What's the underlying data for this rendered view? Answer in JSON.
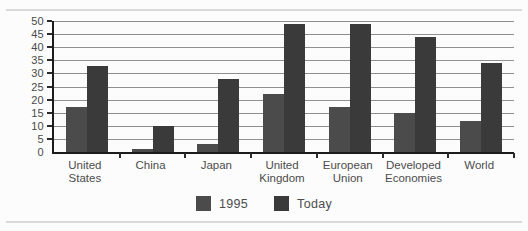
{
  "page": {
    "background": "#fcfcfc",
    "rule_color": "#d9d9d9"
  },
  "chart_data": {
    "type": "bar",
    "title": "",
    "xlabel": "",
    "ylabel": "",
    "categories": [
      "United\nStates",
      "China",
      "Japan",
      "United\nKingdom",
      "European\nUnion",
      "Developed\nEconomies",
      "World"
    ],
    "series": [
      {
        "name": "1995",
        "color": "#4b4b4b",
        "values": [
          17,
          1,
          3,
          22,
          17,
          15,
          12
        ]
      },
      {
        "name": "Today",
        "color": "#3a3a3a",
        "values": [
          33,
          10,
          28,
          49,
          49,
          44,
          34
        ]
      }
    ],
    "ylim": [
      0,
      50
    ],
    "ytick_step": 5,
    "ytick_labels": [
      "50",
      "45",
      "40",
      "35",
      "30",
      "25",
      "20",
      "15",
      "10",
      "5",
      "0"
    ],
    "grid": true,
    "gridline_color": "#8f8f8f",
    "axis_color": "#1c1c1c",
    "legend_position": "bottom"
  }
}
